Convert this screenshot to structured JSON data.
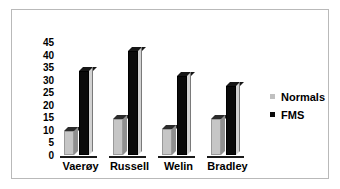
{
  "chart_data": {
    "type": "bar",
    "title": "",
    "subtitle": "",
    "xlabel": "",
    "ylabel": "",
    "categories": [
      "Vaerøy",
      "Russell",
      "Welin",
      "Bradley"
    ],
    "series": [
      {
        "name": "Normals",
        "color": "#c6c6c6",
        "values": [
          11,
          16,
          12,
          16
        ]
      },
      {
        "name": "FMS",
        "color": "#0a0a0a",
        "values": [
          35,
          43,
          33,
          29
        ]
      }
    ],
    "ylim": [
      0,
      45
    ],
    "yticks": [
      45,
      40,
      35,
      30,
      25,
      20,
      15,
      10,
      5,
      0
    ],
    "ytick_labels": [
      "45",
      "40",
      "35",
      "30",
      "25",
      "20",
      "15",
      "10",
      "5",
      "0"
    ],
    "grid": false,
    "legend_position": "right",
    "style": "3d-column"
  },
  "legend": {
    "entries": [
      {
        "label": "Normals",
        "marker": "square",
        "color": "#c0c0c0"
      },
      {
        "label": "FMS",
        "marker": "square",
        "color": "#0a0a0a"
      }
    ]
  },
  "colors": {
    "background": "#ffffff",
    "frame": "#b9b9b9",
    "text": "#000000",
    "normals": "#c6c6c6",
    "fms": "#0a0a0a"
  }
}
